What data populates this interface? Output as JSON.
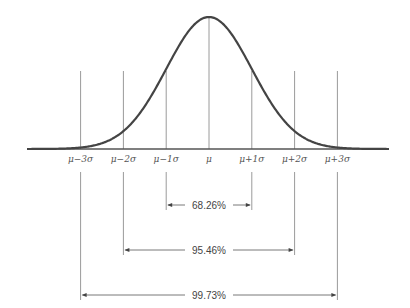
{
  "diagram": {
    "curve_color": "#444444",
    "line_color": "#9a9a9a",
    "ticks": [
      {
        "sigma": -3,
        "label": "μ−3σ"
      },
      {
        "sigma": -2,
        "label": "μ−2σ"
      },
      {
        "sigma": -1,
        "label": "μ−1σ"
      },
      {
        "sigma": 0,
        "label": "μ"
      },
      {
        "sigma": 1,
        "label": "μ+1σ"
      },
      {
        "sigma": 2,
        "label": "μ+2σ"
      },
      {
        "sigma": 3,
        "label": "μ+3σ"
      }
    ],
    "ranges": [
      {
        "k": 1,
        "label": "68.26%"
      },
      {
        "k": 2,
        "label": "95.46%"
      },
      {
        "k": 3,
        "label": "99.73%"
      }
    ]
  }
}
